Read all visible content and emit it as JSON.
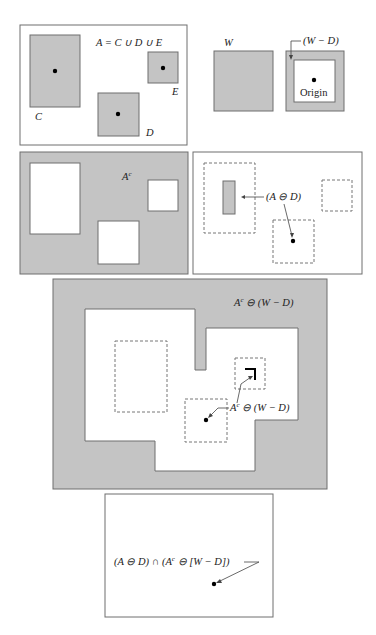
{
  "figure": {
    "colors": {
      "gray_fill": "#c4c4c4",
      "border": "#6e6e6e",
      "dot": "#000000",
      "background": "#ffffff"
    },
    "panels": [
      {
        "id": "set-a",
        "label": "A = C ∪ D ∪ E",
        "components": [
          {
            "name": "C",
            "label": "C"
          },
          {
            "name": "D",
            "label": "D"
          },
          {
            "name": "E",
            "label": "E"
          }
        ]
      },
      {
        "id": "structuring-elements",
        "w_label": "W",
        "wd_label": "(W − D)",
        "origin_label": "Origin"
      },
      {
        "id": "complement",
        "label": "A"
      },
      {
        "id": "erosion-a-by-d",
        "label": "(A ⊖ D)"
      },
      {
        "id": "erosion-ac-by-wd",
        "top_label": "A",
        "inner_label": "A"
      },
      {
        "id": "intersection",
        "label": "(A ⊖ D) ∩ (A"
      }
    ],
    "text": {
      "complement_sup": "c",
      "erosion_suffix": " ⊖ (W − D)",
      "intersection_suffix": " ⊖ [W − D])"
    }
  }
}
